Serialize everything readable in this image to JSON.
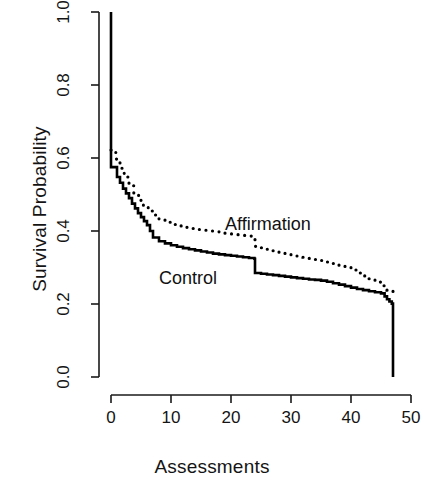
{
  "chart_data": {
    "type": "line",
    "subtype": "kaplan-meier-step",
    "title": "",
    "xlabel": "Assessments",
    "ylabel": "Survival Probability",
    "xlim": [
      0,
      50
    ],
    "ylim": [
      0.0,
      1.0
    ],
    "xticks": [
      0,
      10,
      20,
      30,
      40,
      50
    ],
    "xtick_labels": [
      "0",
      "10",
      "20",
      "30",
      "40",
      "50"
    ],
    "yticks": [
      0.0,
      0.2,
      0.4,
      0.6,
      0.8,
      1.0
    ],
    "ytick_labels": [
      "0.0",
      "0.2",
      "0.4",
      "0.6",
      "0.8",
      "1.0"
    ],
    "grid": false,
    "legend": "inline-annotations",
    "series": [
      {
        "name": "Control",
        "linestyle": "solid",
        "color": "#000000",
        "linewidth": 2.6,
        "label_position": {
          "x": 8.0,
          "y": 0.272
        },
        "x": [
          0,
          0,
          0.6,
          1,
          1.5,
          2,
          2.5,
          3,
          3.5,
          4,
          4.5,
          5,
          5.5,
          6,
          6.5,
          7,
          8,
          9,
          10,
          11,
          12,
          13,
          14,
          15,
          16,
          17,
          18,
          19,
          20,
          21,
          22,
          23,
          23.9,
          24,
          25,
          26,
          27,
          28,
          29,
          30,
          31,
          32,
          33,
          34,
          35,
          36,
          37,
          38,
          39,
          40,
          41,
          42,
          43,
          44,
          45,
          45.6,
          46,
          46.4,
          46.8,
          47,
          47
        ],
        "y": [
          1.0,
          0.575,
          0.575,
          0.548,
          0.532,
          0.516,
          0.503,
          0.49,
          0.475,
          0.462,
          0.449,
          0.438,
          0.427,
          0.416,
          0.4,
          0.382,
          0.372,
          0.366,
          0.361,
          0.357,
          0.353,
          0.35,
          0.347,
          0.344,
          0.341,
          0.338,
          0.336,
          0.334,
          0.332,
          0.33,
          0.328,
          0.326,
          0.324,
          0.285,
          0.283,
          0.281,
          0.279,
          0.277,
          0.275,
          0.273,
          0.271,
          0.269,
          0.267,
          0.266,
          0.264,
          0.261,
          0.257,
          0.253,
          0.249,
          0.245,
          0.241,
          0.238,
          0.235,
          0.232,
          0.229,
          0.221,
          0.213,
          0.207,
          0.201,
          0.198,
          0.0
        ]
      },
      {
        "name": "Affirmation",
        "linestyle": "dotted",
        "color": "#000000",
        "linewidth": 2.6,
        "label_position": {
          "x": 19.0,
          "y": 0.418
        },
        "x": [
          0,
          0.8,
          1.5,
          2.2,
          3,
          3.8,
          4.6,
          5.4,
          6.2,
          7,
          8,
          9,
          10,
          11,
          12,
          13,
          14,
          15,
          16,
          17,
          18,
          19,
          20,
          21,
          22,
          23,
          23.9,
          24,
          25,
          26,
          27,
          28,
          29,
          30,
          31,
          32,
          33,
          34,
          35,
          36,
          37,
          38,
          39,
          40,
          41,
          42,
          43,
          44,
          45,
          46,
          47
        ],
        "y": [
          0.622,
          0.597,
          0.572,
          0.548,
          0.524,
          0.503,
          0.484,
          0.468,
          0.455,
          0.444,
          0.432,
          0.424,
          0.418,
          0.414,
          0.41,
          0.407,
          0.404,
          0.402,
          0.4,
          0.398,
          0.396,
          0.394,
          0.392,
          0.39,
          0.388,
          0.386,
          0.384,
          0.358,
          0.354,
          0.35,
          0.346,
          0.342,
          0.338,
          0.334,
          0.331,
          0.328,
          0.325,
          0.322,
          0.319,
          0.315,
          0.311,
          0.306,
          0.3,
          0.293,
          0.285,
          0.277,
          0.269,
          0.26,
          0.25,
          0.238,
          0.228
        ]
      }
    ]
  },
  "labels": {
    "control": "Control",
    "affirmation": "Affirmation"
  },
  "axes": {
    "x_title": "Assessments",
    "y_title": "Survival Probability"
  },
  "colors": {
    "ink": "#141414",
    "line": "#000000",
    "background": "#ffffff"
  }
}
